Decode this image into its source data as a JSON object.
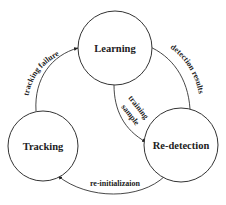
{
  "diagram": {
    "type": "cycle",
    "nodes": [
      {
        "id": "learning",
        "label": "Learning"
      },
      {
        "id": "tracking",
        "label": "Tracking"
      },
      {
        "id": "redetection",
        "label": "Re-detection"
      }
    ],
    "edges": [
      {
        "from": "tracking",
        "to": "learning",
        "label": "tracking failure"
      },
      {
        "from": "learning",
        "to": "redetection",
        "label_line1": "training",
        "label_line2": "sample"
      },
      {
        "from": "redetection",
        "to": "learning",
        "label": "detection results"
      },
      {
        "from": "redetection",
        "to": "tracking",
        "label": "re-initializaion"
      }
    ]
  }
}
